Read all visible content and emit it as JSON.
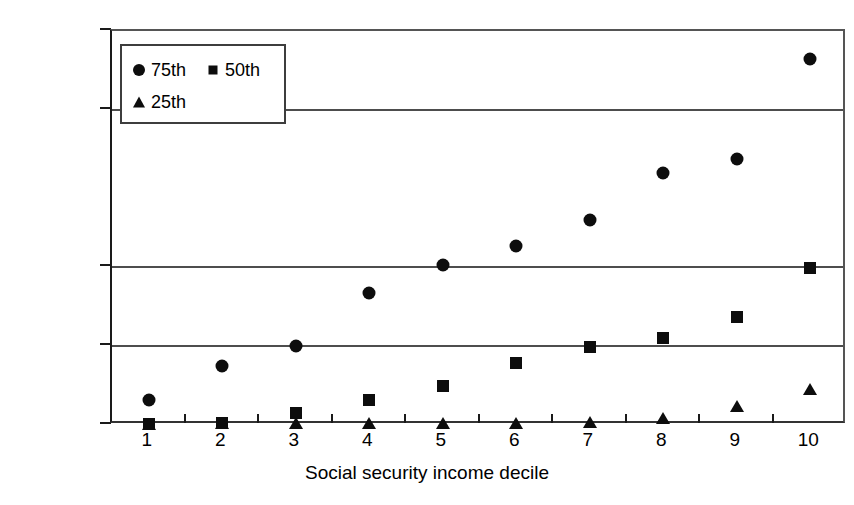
{
  "chart_data": {
    "type": "scatter",
    "title": "",
    "xlabel": "Social security income decile",
    "ylabel": "",
    "categories": [
      "1",
      "2",
      "3",
      "4",
      "5",
      "6",
      "7",
      "8",
      "9",
      "10"
    ],
    "x": [
      1,
      2,
      3,
      4,
      5,
      6,
      7,
      8,
      9,
      10
    ],
    "ylim": [
      0,
      20000
    ],
    "ytick_values": [
      20000,
      16000,
      16000,
      8000,
      4000,
      0
    ],
    "ytick_labels": [
      "$20,000",
      "$16,000",
      "$16,000",
      "$8,000",
      "$4,000",
      "$0"
    ],
    "grid": true,
    "legend_position": "top-left inside",
    "series": [
      {
        "name": "75th",
        "marker": "circle",
        "values": [
          1250,
          3000,
          4000,
          6700,
          8100,
          9100,
          10400,
          12800,
          13500,
          18600
        ]
      },
      {
        "name": "50th",
        "marker": "square",
        "values": [
          50,
          120,
          620,
          1250,
          2000,
          3150,
          3950,
          4400,
          5500,
          7950
        ]
      },
      {
        "name": "25th",
        "marker": "triangle",
        "values": [
          0,
          40,
          60,
          60,
          60,
          70,
          80,
          300,
          900,
          1800
        ]
      }
    ],
    "colors": {
      "marker": "#0d0d0d",
      "axis": "#1a1a1a",
      "grid": "#4d4d4d",
      "background": "#ffffff"
    }
  },
  "legend": {
    "rows": [
      [
        {
          "marker": "circle",
          "label": "75th"
        },
        {
          "marker": "square",
          "label": "50th"
        }
      ],
      [
        {
          "marker": "triangle",
          "label": "25th"
        }
      ]
    ]
  }
}
